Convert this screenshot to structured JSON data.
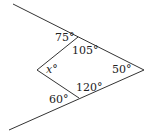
{
  "diagram": {
    "type": "geometry-angles",
    "points": {
      "apex": [
        144,
        70
      ],
      "upper_ray_end": [
        13,
        4
      ],
      "lower_ray_end": [
        9,
        130
      ],
      "top_vertex": [
        78,
        37
      ],
      "left_vertex": [
        37,
        70
      ],
      "bottom_vertex": [
        79,
        98
      ]
    },
    "labels": {
      "top_exterior": "75°",
      "top_interior": "105°",
      "left_interior_var": "x",
      "left_interior_deg": "°",
      "apex_angle": "50°",
      "bottom_interior": "120°",
      "bottom_exterior": "60°"
    },
    "line_color": "#333333"
  }
}
